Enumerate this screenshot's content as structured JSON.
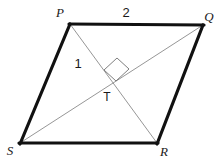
{
  "figure": {
    "type": "geometry-diagram",
    "shape": "parallelogram",
    "canvas": {
      "width": 224,
      "height": 160,
      "background": "#ffffff"
    },
    "colors": {
      "side_stroke": "#111111",
      "diagonal_stroke": "#8a8a8a",
      "right_angle_stroke": "#6f6f6f",
      "label_text": "#1a1a1a"
    },
    "stroke_widths": {
      "side": 3.2,
      "diagonal": 0.9,
      "right_angle": 0.9
    },
    "vertices": [
      {
        "name": "P",
        "label": "P",
        "x": 70,
        "y": 24,
        "label_x": 60,
        "label_y": 17
      },
      {
        "name": "Q",
        "label": "Q",
        "x": 203,
        "y": 25,
        "label_x": 205,
        "label_y": 20
      },
      {
        "name": "R",
        "label": "R",
        "x": 157,
        "y": 143,
        "label_x": 161,
        "label_y": 156
      },
      {
        "name": "S",
        "label": "S",
        "x": 20,
        "y": 143,
        "label_x": 8,
        "label_y": 154
      }
    ],
    "sides": [
      {
        "name": "PQ",
        "from": "P",
        "to": "Q",
        "x1": 70,
        "y1": 24,
        "x2": 203,
        "y2": 25
      },
      {
        "name": "QR",
        "from": "Q",
        "to": "R",
        "x1": 203,
        "y1": 25,
        "x2": 157,
        "y2": 143
      },
      {
        "name": "RS",
        "from": "R",
        "to": "S",
        "x1": 157,
        "y1": 143,
        "x2": 20,
        "y2": 143
      },
      {
        "name": "SP",
        "from": "S",
        "to": "P",
        "x1": 20,
        "y1": 143,
        "x2": 70,
        "y2": 24
      }
    ],
    "diagonals": [
      {
        "name": "PR",
        "from": "P",
        "to": "R",
        "x1": 70,
        "y1": 24,
        "x2": 157,
        "y2": 143
      },
      {
        "name": "SQ",
        "from": "S",
        "to": "Q",
        "x1": 20,
        "y1": 143,
        "x2": 203,
        "y2": 25
      }
    ],
    "intersection": {
      "name": "T",
      "label": "T",
      "x": 113,
      "y": 80,
      "label_x": 102,
      "label_y": 101
    },
    "right_angle_marker": {
      "points": "104,70 117,58 129,69 116,81",
      "at": "T"
    },
    "angle_labels": [
      {
        "name": "angle-1",
        "label": "1",
        "x": 77,
        "y": 67
      },
      {
        "name": "angle-2",
        "label": "2",
        "x": 124,
        "y": 17
      }
    ]
  }
}
